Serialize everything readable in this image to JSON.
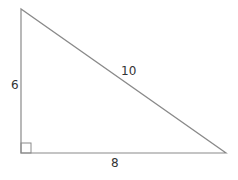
{
  "diagram": {
    "type": "right-triangle",
    "stroke_color": "#8a8a8a",
    "label_color": "#333333",
    "vertices": {
      "top_left": [
        21,
        9
      ],
      "bottom_left": [
        21,
        153
      ],
      "bottom_right": [
        226,
        153
      ]
    },
    "right_angle_marker": true,
    "sides": {
      "vertical_leg": "6",
      "horizontal_leg": "8",
      "hypotenuse": "10"
    }
  }
}
